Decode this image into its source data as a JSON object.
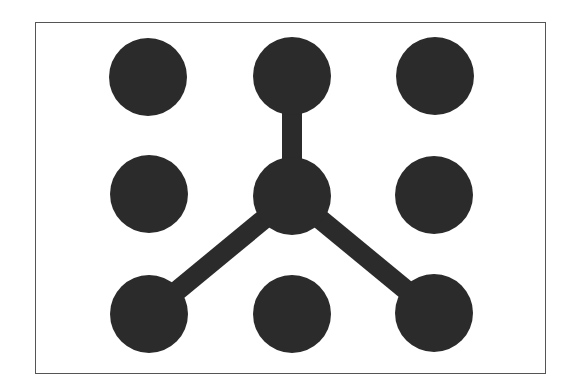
{
  "diagram": {
    "type": "pattern-lock",
    "grid": {
      "rows": 3,
      "cols": 3
    },
    "colors": {
      "dot": "#2b2b2b",
      "line": "#2b2b2b",
      "border": "#555555",
      "background": "#ffffff"
    },
    "dots": [
      {
        "id": "r1c1",
        "cx": 148,
        "cy": 77,
        "r": 39
      },
      {
        "id": "r1c2",
        "cx": 292,
        "cy": 76,
        "r": 39
      },
      {
        "id": "r1c3",
        "cx": 435,
        "cy": 76,
        "r": 39
      },
      {
        "id": "r2c1",
        "cx": 149,
        "cy": 194,
        "r": 39
      },
      {
        "id": "r2c2",
        "cx": 292,
        "cy": 196,
        "r": 39
      },
      {
        "id": "r2c3",
        "cx": 434,
        "cy": 195,
        "r": 39
      },
      {
        "id": "r3c1",
        "cx": 149,
        "cy": 314,
        "r": 39
      },
      {
        "id": "r3c2",
        "cx": 292,
        "cy": 314,
        "r": 39
      },
      {
        "id": "r3c3",
        "cx": 434,
        "cy": 313,
        "r": 39
      }
    ],
    "connections": [
      {
        "from": "r1c2",
        "to": "r2c2"
      },
      {
        "from": "r2c2",
        "to": "r3c1"
      },
      {
        "from": "r2c2",
        "to": "r3c3"
      }
    ],
    "line_width": 20
  }
}
